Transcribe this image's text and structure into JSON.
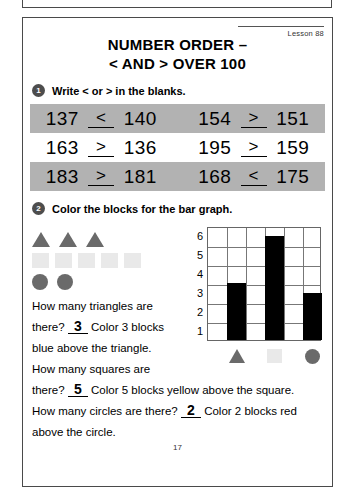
{
  "worksheet": {
    "lesson_label": "Lesson 88",
    "title_line1": "NUMBER ORDER –",
    "title_line2": "< AND > OVER 100",
    "page_number": "17"
  },
  "section1": {
    "badge": "1",
    "instruction": "Write < or > in the blanks.",
    "rows": [
      {
        "shaded": true,
        "left": {
          "a": "137",
          "symbol": "<",
          "b": "140"
        },
        "right": {
          "a": "154",
          "symbol": ">",
          "b": "151"
        }
      },
      {
        "shaded": false,
        "left": {
          "a": "163",
          "symbol": ">",
          "b": "136"
        },
        "right": {
          "a": "195",
          "symbol": ">",
          "b": "159"
        }
      },
      {
        "shaded": true,
        "left": {
          "a": "183",
          "symbol": ">",
          "b": "181"
        },
        "right": {
          "a": "168",
          "symbol": "<",
          "b": "175"
        }
      }
    ]
  },
  "section2": {
    "badge": "2",
    "instruction": "Color the blocks for the bar graph.",
    "shape_key": {
      "triangle_count": 3,
      "square_count": 5,
      "circle_count": 2,
      "triangle_color": "#6a6a6a",
      "square_color": "#e9e9e9",
      "circle_color": "#6a6a6a"
    },
    "questions": {
      "q1_part1": "How many triangles are",
      "q1_part2": "there?",
      "q1_answer": "3",
      "q1_part3": "Color 3 blocks",
      "q1_part4": "blue above the triangle.",
      "q2_part1": "How many squares are",
      "q2_part2": "there?",
      "q2_answer": "5",
      "q2_part3": "Color 5 blocks yellow above the square.",
      "q3_part1": "How many circles are there?",
      "q3_answer": "2",
      "q3_part2": "Color 2 blocks red",
      "q3_part3": "above the circle."
    }
  },
  "chart_data": {
    "type": "bar",
    "title": "",
    "xlabel": "",
    "ylabel": "",
    "categories": [
      "triangle",
      "square",
      "circle"
    ],
    "values": [
      3,
      5.5,
      2.5
    ],
    "tick_labels": [
      "6",
      "5",
      "4",
      "3",
      "2",
      "1"
    ],
    "ylim": [
      0,
      6
    ],
    "grid": true,
    "grid_columns": 6,
    "grid_rows": 6,
    "bar_columns": [
      1,
      3,
      5
    ],
    "bar_color": "#000000",
    "legend": "none"
  }
}
